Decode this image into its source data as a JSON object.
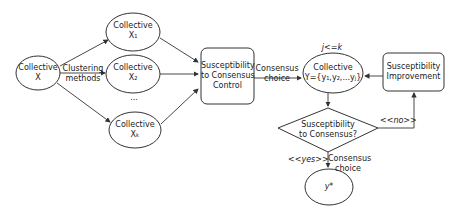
{
  "nodes": {
    "collective_x": {
      "line1": "Collective",
      "line2": "X"
    },
    "collective_x1": {
      "line1": "Collective",
      "line2": "X₁"
    },
    "collective_x2": {
      "line1": "Collective",
      "line2": "X₂"
    },
    "collective_xk": {
      "line1": "Collective",
      "line2": "Xₖ"
    },
    "ellipsis": "...",
    "susceptibility_control": {
      "line1": "Susceptibility",
      "line2": "to Consensus",
      "line3": "Control"
    },
    "collective_y": {
      "line1": "Collective",
      "line2": "Y={y₁,y₂,...yⱼ}"
    },
    "susceptibility_improvement": {
      "line1": "Susceptibility",
      "line2": "Improvement"
    },
    "decision": {
      "line1": "Susceptibility",
      "line2": "to Consensus?"
    },
    "y_star": "y*"
  },
  "edge_labels": {
    "clustering": {
      "line1": "Clustering",
      "line2": "methods"
    },
    "consensus_choice_1": {
      "line1": "Consensus",
      "line2": "choice"
    },
    "j_le_k": "j<=k",
    "no": "<<no>>",
    "yes": "<<yes>>",
    "consensus_choice_2": {
      "line1": "Consensus",
      "line2": "choice"
    }
  }
}
